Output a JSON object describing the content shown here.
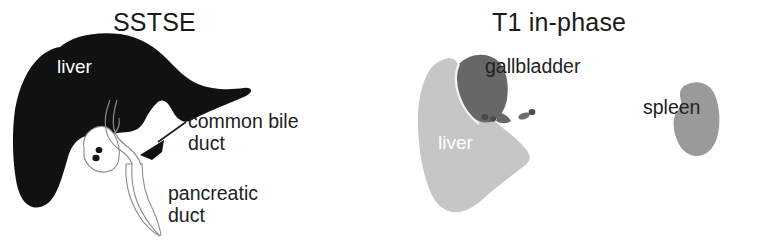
{
  "figure": {
    "type": "medical-illustration",
    "width": 758,
    "height": 245,
    "background_color": "#ffffff"
  },
  "panels": [
    {
      "id": "sstse",
      "title": "SSTSE",
      "organs": [
        {
          "name": "liver",
          "label": "liver",
          "label_color": "#ffffff",
          "fill_color": "#111111",
          "rendering": "solid-black-silhouette"
        },
        {
          "name": "gallbladder",
          "label": "",
          "fill_color": "#ffffff",
          "outline_color": "#777777",
          "rendering": "white-outline"
        },
        {
          "name": "gallstones",
          "count": 2,
          "fill_color": "#141414"
        },
        {
          "name": "common bile duct",
          "label": "common bile\nduct",
          "outline_color": "#888888"
        },
        {
          "name": "pancreatic duct",
          "label": "pancreatic\nduct",
          "outline_color": "#888888"
        }
      ],
      "annotations": [
        {
          "id": "common-bile-duct",
          "line1": "common bile",
          "line2": "duct",
          "has_arrow": true,
          "arrow_color": "#111111"
        },
        {
          "id": "pancreatic-duct",
          "line1": "pancreatic",
          "line2": "duct",
          "has_arrow": false
        }
      ]
    },
    {
      "id": "t1-in-phase",
      "title": "T1 in-phase",
      "organs": [
        {
          "name": "liver",
          "label": "liver",
          "label_color": "#ffffff",
          "fill_color": "#c6c6c6",
          "rendering": "light-gray-silhouette"
        },
        {
          "name": "gallbladder",
          "label": "gallbladder",
          "label_color": "#222222",
          "fill_color": "#676767",
          "rendering": "dark-gray-silhouette"
        },
        {
          "name": "gallstones",
          "count": 5,
          "fill_color": "#4a4a4a"
        },
        {
          "name": "spleen",
          "label": "spleen",
          "label_color": "#222222",
          "fill_color": "#9a9a9a",
          "rendering": "medium-gray-silhouette"
        }
      ],
      "annotations": [
        {
          "id": "gallbladder",
          "line1": "gallbladder",
          "has_arrow": false
        },
        {
          "id": "spleen",
          "line1": "spleen",
          "has_arrow": false
        }
      ]
    }
  ],
  "colors": {
    "liver_sstse": "#111111",
    "liver_t1": "#c6c6c6",
    "gallbladder_t1": "#676767",
    "spleen_t1": "#9a9a9a",
    "stone": "#141414",
    "duct_outline": "#888888",
    "text": "#222222",
    "text_inverse": "#ffffff"
  }
}
